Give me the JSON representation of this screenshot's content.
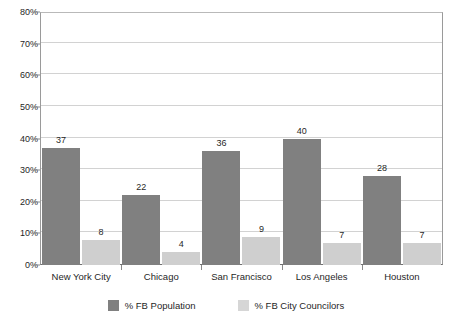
{
  "chart_data": {
    "type": "bar",
    "title": "",
    "xlabel": "",
    "ylabel": "",
    "ylim": [
      0,
      80
    ],
    "ytick_labels": [
      "0%",
      "10%",
      "20%",
      "30%",
      "40%",
      "50%",
      "60%",
      "70%",
      "80%"
    ],
    "ytick_values": [
      0,
      10,
      20,
      30,
      40,
      50,
      60,
      70,
      80
    ],
    "grid": true,
    "legend_position": "bottom",
    "categories": [
      "New York City",
      "Chicago",
      "San Francisco",
      "Los Angeles",
      "Houston"
    ],
    "series": [
      {
        "name": "% FB Population",
        "color": "#808080",
        "values": [
          37,
          22,
          36,
          40,
          28
        ]
      },
      {
        "name": "% FB City Councilors",
        "color": "#cfcfcf",
        "values": [
          8,
          4,
          9,
          7,
          7
        ]
      }
    ]
  },
  "legend": {
    "items": [
      {
        "label": "% FB Population",
        "swatch": "primary"
      },
      {
        "label": "% FB City Councilors",
        "swatch": "secondary"
      }
    ]
  }
}
